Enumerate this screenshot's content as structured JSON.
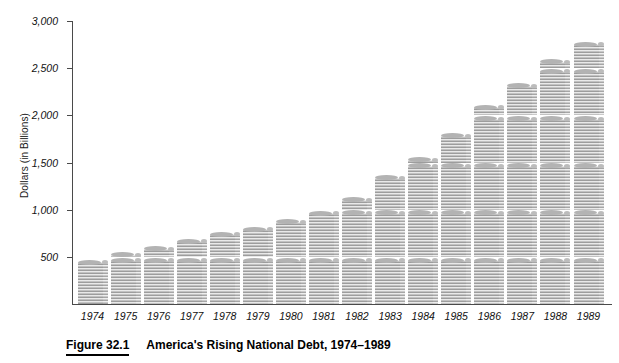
{
  "figure": {
    "number_label": "Figure 32.1",
    "caption_title": "America's Rising National Debt, 1974–1989"
  },
  "axes": {
    "y_title": "Dollars (in Billions)",
    "y_ticks": [
      "3,000",
      "2,500",
      "2,000",
      "1,500",
      "1,000",
      "500"
    ]
  },
  "colors": {
    "axis": "#4a4a4a",
    "coin_light": "#e9e9e9",
    "coin_mid": "#c2c2c2",
    "coin_dark": "#9d9d9d",
    "text": "#111111"
  },
  "chart_data": {
    "type": "bar",
    "title": "America's Rising National Debt, 1974–1989",
    "subtitle": "",
    "xlabel": "",
    "ylabel": "Dollars (in Billions)",
    "ylim": [
      0,
      3000
    ],
    "ytick_values": [
      500,
      1000,
      1500,
      2000,
      2500,
      3000
    ],
    "grid": false,
    "legend": null,
    "marker_style": "stacked-coins",
    "categories": [
      "1974",
      "1975",
      "1976",
      "1977",
      "1978",
      "1979",
      "1980",
      "1981",
      "1982",
      "1983",
      "1984",
      "1985",
      "1986",
      "1987",
      "1988",
      "1989"
    ],
    "values": [
      475,
      533,
      620,
      698,
      771,
      826,
      908,
      994,
      1137,
      1371,
      1564,
      1817,
      2120,
      2346,
      2601,
      2790
    ],
    "series": [
      {
        "name": "National Debt",
        "values": [
          475,
          533,
          620,
          698,
          771,
          826,
          908,
          994,
          1137,
          1371,
          1564,
          1817,
          2120,
          2346,
          2601,
          2790
        ]
      }
    ]
  }
}
